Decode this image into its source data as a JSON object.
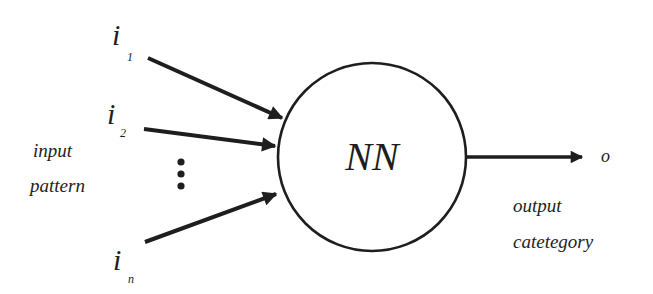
{
  "diagram": {
    "title": "",
    "node": {
      "label": "NN"
    },
    "inputs": [
      {
        "symbol": "i",
        "subscript": "1"
      },
      {
        "symbol": "i",
        "subscript": "2"
      },
      {
        "symbol": "i",
        "subscript": "n"
      }
    ],
    "ellipsis": "⋮",
    "input_group_label": [
      "input",
      "pattern"
    ],
    "output": {
      "symbol": "o"
    },
    "output_group_label": [
      "output",
      "catetegory"
    ],
    "colors": {
      "stroke": "#1e1e1e",
      "background": "#ffffff"
    }
  }
}
